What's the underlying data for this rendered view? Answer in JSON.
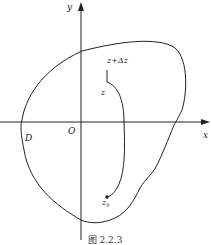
{
  "figure": {
    "caption": "图 2.2.3",
    "axes": {
      "x_label": "x",
      "y_label": "y",
      "origin_label": "O"
    },
    "region_label": "D",
    "points": {
      "z": "z",
      "z_plus_dz": "z+Δz",
      "z0": "z",
      "z0_sub": "0"
    },
    "colors": {
      "stroke": "#222222",
      "background": "#ffffff"
    }
  }
}
